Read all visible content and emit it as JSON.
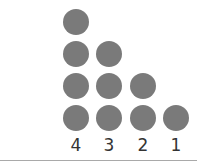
{
  "figure": {
    "dot_color": "#7a7a7a",
    "columns": [
      {
        "label": "4",
        "count": 4
      },
      {
        "label": "3",
        "count": 3
      },
      {
        "label": "2",
        "count": 2
      },
      {
        "label": "1",
        "count": 1
      }
    ]
  }
}
